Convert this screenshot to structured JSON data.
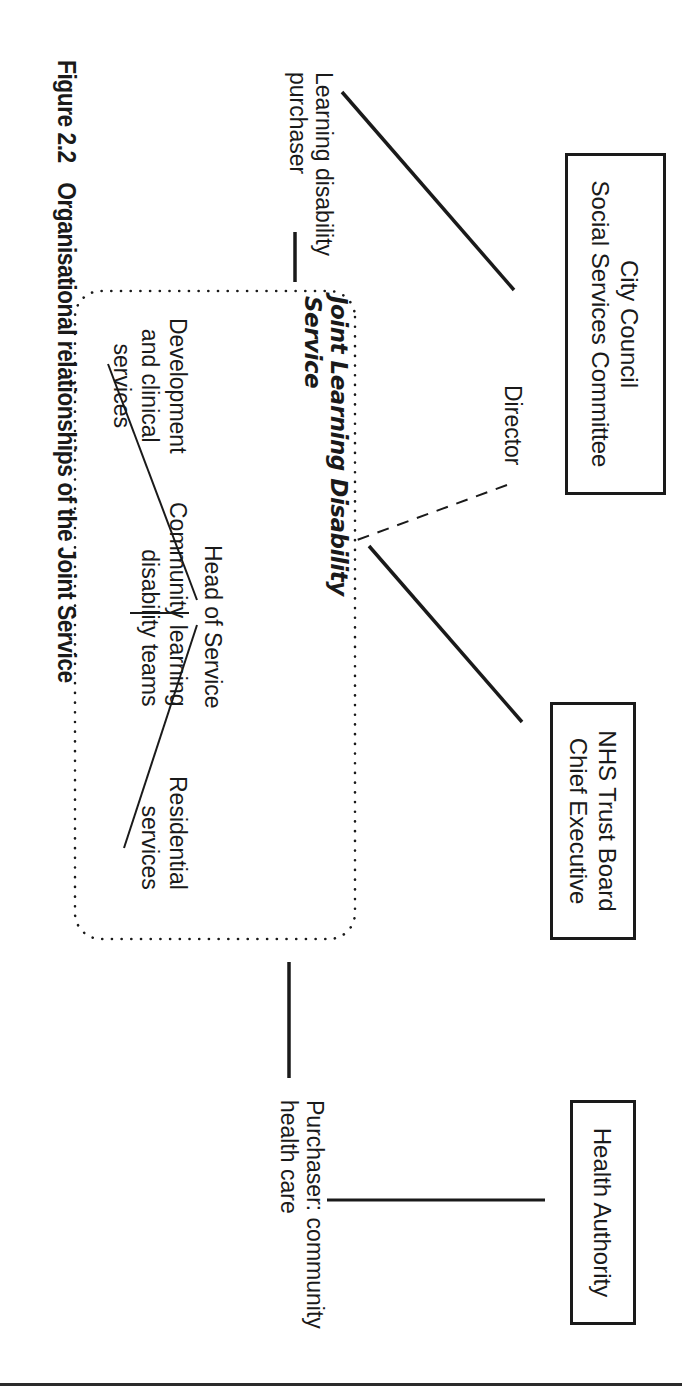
{
  "figure": {
    "caption_number": "Figure 2.2",
    "caption_title": "Organisational relationships of the Joint Service",
    "orientation": "rotated 90° clockwise"
  },
  "nodes": {
    "city_council": {
      "line1": "City Council",
      "line2": "Social Services Committee"
    },
    "nhs_trust": {
      "line1": "NHS Trust Board",
      "line2": "Chief Executive"
    },
    "health_authority": {
      "line1": "Health Authority"
    },
    "director": "Director",
    "ld_purchaser": {
      "line1": "Learning disability",
      "line2": "purchaser"
    },
    "chc_purchaser": {
      "line1": "Purchaser: community",
      "line2": "health care"
    },
    "joint_service": {
      "title_line1": "Joint Learning Disability",
      "title_line2": "Service",
      "head": "Head of Service",
      "units": [
        {
          "line1": "Development",
          "line2": "and clinical",
          "line3": "services"
        },
        {
          "line1": "Community learning",
          "line2": "disability teams"
        },
        {
          "line1": "Residential",
          "line2": "services"
        }
      ]
    }
  },
  "edges": [
    {
      "from": "Director",
      "to": "Learning disability purchaser",
      "style": "solid"
    },
    {
      "from": "Director",
      "to": "Joint Learning Disability Service",
      "style": "dashed"
    },
    {
      "from": "Learning disability purchaser",
      "to": "Joint Learning Disability Service",
      "style": "solid"
    },
    {
      "from": "NHS Trust Board Chief Executive",
      "to": "Joint Learning Disability Service",
      "style": "solid"
    },
    {
      "from": "Joint Learning Disability Service",
      "to": "Purchaser: community health care",
      "style": "solid"
    },
    {
      "from": "Purchaser: community health care",
      "to": "Health Authority",
      "style": "solid"
    },
    {
      "from": "Head of Service",
      "to": "Development and clinical services",
      "style": "solid"
    },
    {
      "from": "Head of Service",
      "to": "Community learning disability teams",
      "style": "solid"
    },
    {
      "from": "Head of Service",
      "to": "Residential services",
      "style": "solid"
    }
  ],
  "colors": {
    "ink": "#1a1a1a",
    "background": "#ffffff"
  }
}
